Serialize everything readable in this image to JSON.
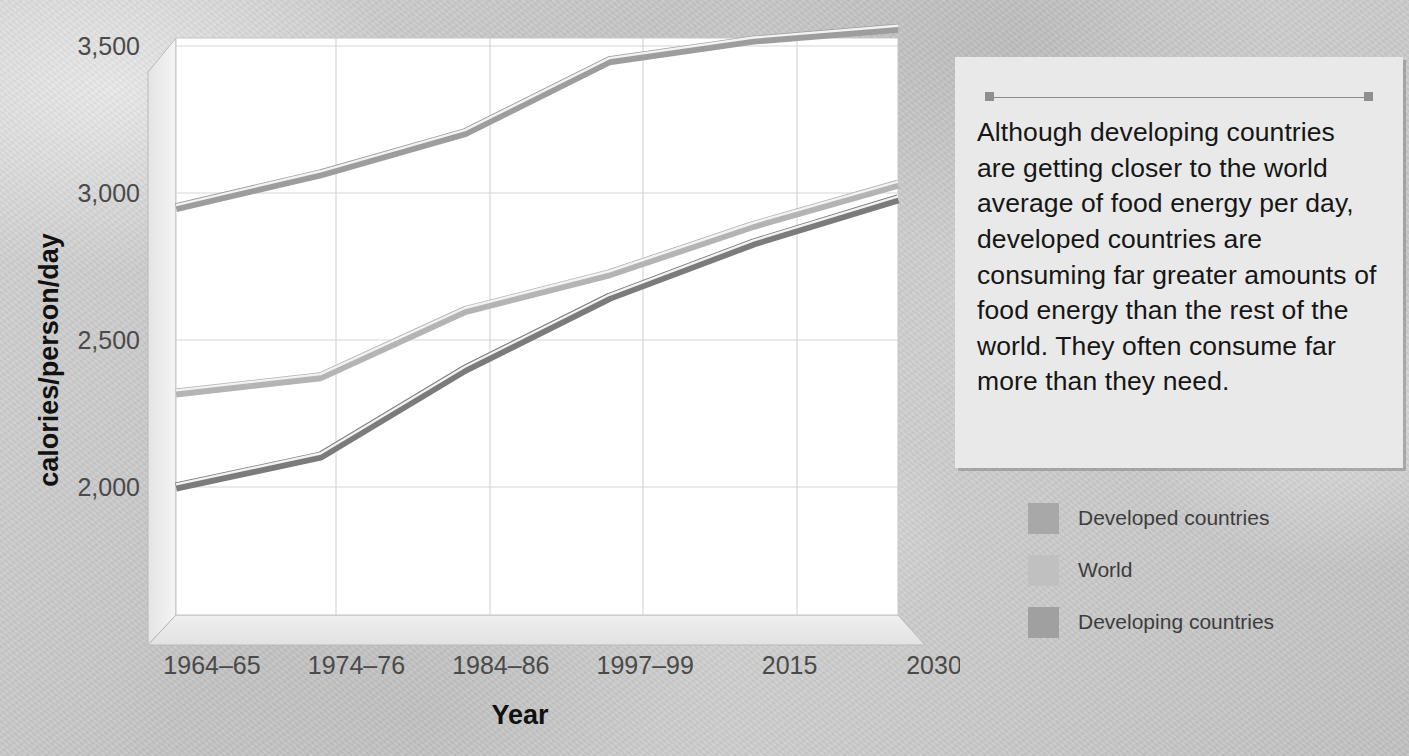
{
  "chart_data": {
    "type": "line",
    "title": "",
    "xlabel": "Year",
    "ylabel": "calories/person/day",
    "categories": [
      "1964–65",
      "1974–76",
      "1984–86",
      "1997–99",
      "2015",
      "2030"
    ],
    "yticks": [
      "2,000",
      "2,500",
      "3,000",
      "3,500"
    ],
    "ytick_values": [
      2000,
      2500,
      3000,
      3500
    ],
    "ylim": [
      1850,
      3600
    ],
    "grid": true,
    "legend_position": "right",
    "series": [
      {
        "name": "Developed countries",
        "color": "#9d9d9d",
        "values": [
          2950,
          3065,
          3205,
          3450,
          3520,
          3560
        ]
      },
      {
        "name": "World",
        "color": "#b4b4b4",
        "values": [
          2320,
          2375,
          2600,
          2725,
          2890,
          3030
        ]
      },
      {
        "name": "Developing countries",
        "color": "#7b7b7b",
        "values": [
          2000,
          2105,
          2400,
          2645,
          2830,
          2980
        ]
      }
    ]
  },
  "caption": {
    "text": "Although developing countries are getting closer to the world average of food energy per day, developed countries are consuming far greater amounts of food energy than the rest of the world. They often consume far more than they need."
  },
  "legend": {
    "items": [
      {
        "label": "Developed countries",
        "color": "#a8a8a8"
      },
      {
        "label": "World",
        "color": "#c0c0c0"
      },
      {
        "label": "Developing countries",
        "color": "#a0a0a0"
      }
    ]
  },
  "colors": {
    "background": "#cccccc",
    "plot_face": "#ffffff",
    "caption_bg": "#e9e9e9",
    "grid": "#d0d0d0",
    "text": "#3d3d3d"
  }
}
